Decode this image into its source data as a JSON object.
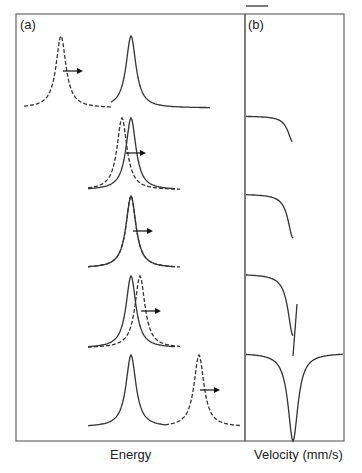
{
  "panels": {
    "a": {
      "label": "(a)",
      "xlabel": "Energy"
    },
    "b": {
      "label": "(b)",
      "xlabel": "Velocity (mm/s)"
    }
  },
  "rows": [
    {
      "solid_x": 131,
      "dashed_x": 61,
      "arrow": [
        63,
        83
      ],
      "b_depth": 0
    },
    {
      "solid_x": 131,
      "dashed_x": 122,
      "arrow": [
        126,
        146
      ],
      "b_depth": 0.3
    },
    {
      "solid_x": 131,
      "dashed_x": 131,
      "arrow": [
        133,
        153
      ],
      "b_depth": 0.5
    },
    {
      "solid_x": 131,
      "dashed_x": 140,
      "arrow": [
        141,
        161
      ],
      "b_depth": 0.7
    },
    {
      "solid_x": 131,
      "dashed_x": 199,
      "arrow": [
        200,
        220
      ],
      "b_depth": 1.0
    }
  ],
  "colors": {
    "line": "#333333",
    "frame": "#666666"
  }
}
